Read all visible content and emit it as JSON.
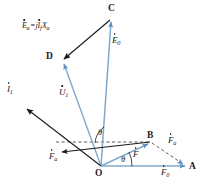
{
  "figure": {
    "background": "#ffffff",
    "width": 203,
    "height": 190,
    "colors": {
      "blue_phasor": "#7FA9CC",
      "blue_phasor_dark": "#5A8FBF",
      "black_vector": "#1A1A1A",
      "dashed": "#4D4D4D",
      "label": "#1A1A1A"
    }
  },
  "vertices": [
    {
      "id": "O",
      "label": "O",
      "x": 101,
      "y": 167,
      "role": "origin"
    },
    {
      "id": "A",
      "label": "A",
      "x": 190,
      "y": 167,
      "role": "axis-end"
    },
    {
      "id": "B",
      "label": "B",
      "x": 151,
      "y": 142,
      "role": "resultant-mmf-tip"
    },
    {
      "id": "C",
      "label": "C",
      "x": 112,
      "y": 14,
      "role": "emf-tip"
    },
    {
      "id": "D",
      "label": "D",
      "x": 59,
      "y": 58,
      "role": "terminal-voltage-tip"
    }
  ],
  "vectors": [
    {
      "id": "E0",
      "name": "excitation-emf",
      "label": "E",
      "subscript": "0",
      "overdot": true,
      "color": "blue",
      "style": "solid",
      "from": "O",
      "to": "C",
      "label_x": 113,
      "label_y": 40
    },
    {
      "id": "U1",
      "name": "terminal-voltage",
      "label": "U",
      "subscript": "1",
      "overdot": true,
      "color": "blue",
      "style": "solid",
      "from": "O",
      "to": "D",
      "label_x": 61,
      "label_y": 92
    },
    {
      "id": "Ea",
      "name": "armature-reaction-emf",
      "label": "E",
      "subscript": "a",
      "overdot": true,
      "expression": "Ėa = jİf Xa",
      "color": "black",
      "style": "solid",
      "from": "C",
      "to": "D",
      "label_x": 23,
      "label_y": 24
    },
    {
      "id": "I1",
      "name": "armature-current",
      "label": "I",
      "subscript": "1",
      "overdot": true,
      "color": "black",
      "style": "solid",
      "from": "O",
      "to": "current-tip",
      "label_x": 8,
      "label_y": 89
    },
    {
      "id": "F0",
      "name": "field-mmf",
      "label": "F",
      "subscript": "0",
      "overdot": true,
      "color": "blue",
      "style": "solid",
      "from": "O",
      "to": "A",
      "label_x": 163,
      "label_y": 171
    },
    {
      "id": "F",
      "name": "resultant-mmf",
      "label": "F",
      "subscript": "",
      "overdot": true,
      "color": "blue",
      "style": "solid",
      "from": "O",
      "to": "B",
      "label_x": 133,
      "label_y": 153
    },
    {
      "id": "Fa_right",
      "name": "armature-reaction-mmf-right",
      "label": "F",
      "subscript": "a",
      "overdot": true,
      "color": "black",
      "style": "dashed",
      "from": "B",
      "to": "A",
      "label_x": 167,
      "label_y": 141
    },
    {
      "id": "Fa_left",
      "name": "armature-reaction-mmf-left",
      "label": "F",
      "subscript": "a",
      "overdot": true,
      "color": "black",
      "style": "solid",
      "from": "B",
      "to": "current-direction",
      "label_x": 50,
      "label_y": 155
    }
  ],
  "angles": [
    {
      "id": "theta-upper",
      "name": "angle-theta-upper",
      "label": "θ",
      "x": 101,
      "y": 135,
      "between": [
        "OD",
        "horizontal"
      ]
    },
    {
      "id": "theta-lower",
      "name": "angle-theta-lower",
      "label": "θ",
      "x": 122,
      "y": 158,
      "between": [
        "OB",
        "OA"
      ]
    }
  ],
  "dashed_lines": [
    {
      "id": "horizontal-through-B",
      "from_x": 56,
      "from_y": 142,
      "to_x": 151,
      "to_y": 142
    },
    {
      "id": "B-to-A",
      "from_x": 151,
      "from_y": 142,
      "to_x": 186,
      "to_y": 166
    }
  ]
}
